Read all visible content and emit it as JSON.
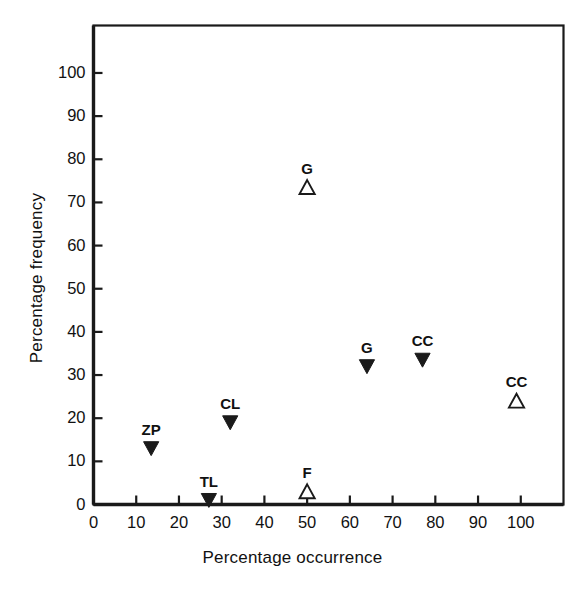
{
  "chart_data": {
    "type": "scatter",
    "title": "",
    "xlabel": "Percentage occurrence",
    "ylabel": "Percentage frequency",
    "xlim": [
      0,
      110
    ],
    "ylim": [
      0,
      111
    ],
    "xticks": [
      0,
      10,
      20,
      30,
      40,
      50,
      60,
      70,
      80,
      90,
      100
    ],
    "xticklabels": [
      "0",
      "10",
      "20",
      "30",
      "40",
      "50",
      "60",
      "70",
      "80",
      "90",
      "100"
    ],
    "yticks": [
      0,
      10,
      20,
      30,
      40,
      50,
      60,
      70,
      80,
      90,
      100
    ],
    "yticklabels": [
      "0",
      "10",
      "20",
      "30",
      "40",
      "50",
      "60",
      "70",
      "80",
      "90",
      "100"
    ],
    "grid": false,
    "legend": false,
    "marker_styles": {
      "filled": "filled-down-triangle",
      "open": "open-up-triangle"
    },
    "points": [
      {
        "label": "ZP",
        "x": 13.5,
        "y": 13.0,
        "marker": "filled"
      },
      {
        "label": "TL",
        "x": 27.0,
        "y": 1.0,
        "marker": "filled"
      },
      {
        "label": "CL",
        "x": 32.0,
        "y": 19.0,
        "marker": "filled"
      },
      {
        "label": "F",
        "x": 50.0,
        "y": 3.0,
        "marker": "open"
      },
      {
        "label": "G",
        "x": 50.0,
        "y": 73.5,
        "marker": "open"
      },
      {
        "label": "G",
        "x": 64.0,
        "y": 32.0,
        "marker": "filled"
      },
      {
        "label": "CC",
        "x": 77.0,
        "y": 33.5,
        "marker": "filled"
      },
      {
        "label": "CC",
        "x": 99.0,
        "y": 24.0,
        "marker": "open"
      }
    ]
  },
  "axis": {
    "x_title": "Percentage occurrence",
    "y_title": "Percentage frequency"
  },
  "colors": {
    "ink": "#1a1a1a",
    "background": "#ffffff"
  }
}
